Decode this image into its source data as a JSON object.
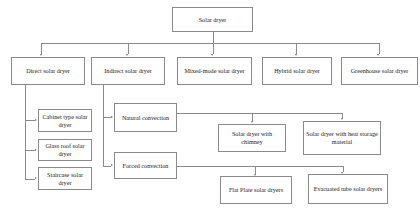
{
  "diagram": {
    "type": "tree-flowchart",
    "orientation": "top-down",
    "colors": {
      "background": "#ffffff",
      "box_border": "#8a8a8a",
      "box_fill": "#ffffff",
      "text": "#1b1b1b",
      "connector": "#8a8a8a",
      "arrow": "#6f6f6f"
    },
    "nodes": {
      "root": "Solar dryer",
      "level2": [
        "Direct solar dryer",
        "Indirect solar dryer",
        "Mixed-mode solar dryer",
        "Hybrid solar dryer",
        "Greenhouse solar dryer"
      ],
      "direct_children": [
        "Cabinet type solar dryer",
        "Glass roof solar dryer",
        "Staircase solar dryer"
      ],
      "indirect_children": [
        "Natural convection",
        "Forced convection"
      ],
      "natural_children": [
        "Solar dryer with chimney",
        "Solar dryer with heat storage material"
      ],
      "forced_children": [
        "Flat Plate solar dryers",
        "Evacuated tube solar dryers"
      ]
    },
    "edges": [
      {
        "from": "Solar dryer",
        "to": "Direct solar dryer"
      },
      {
        "from": "Solar dryer",
        "to": "Indirect solar dryer"
      },
      {
        "from": "Solar dryer",
        "to": "Mixed-mode solar dryer"
      },
      {
        "from": "Solar dryer",
        "to": "Hybrid solar dryer"
      },
      {
        "from": "Solar dryer",
        "to": "Greenhouse solar dryer"
      },
      {
        "from": "Direct solar dryer",
        "to": "Cabinet type solar dryer"
      },
      {
        "from": "Direct solar dryer",
        "to": "Glass roof solar dryer"
      },
      {
        "from": "Direct solar dryer",
        "to": "Staircase solar dryer"
      },
      {
        "from": "Indirect solar dryer",
        "to": "Natural convection"
      },
      {
        "from": "Indirect solar dryer",
        "to": "Forced convection"
      },
      {
        "from": "Natural convection",
        "to": "Solar dryer with chimney"
      },
      {
        "from": "Natural convection",
        "to": "Solar dryer with heat storage material"
      },
      {
        "from": "Forced convection",
        "to": "Flat Plate solar dryers"
      },
      {
        "from": "Forced convection",
        "to": "Evacuated tube solar dryers"
      }
    ]
  }
}
